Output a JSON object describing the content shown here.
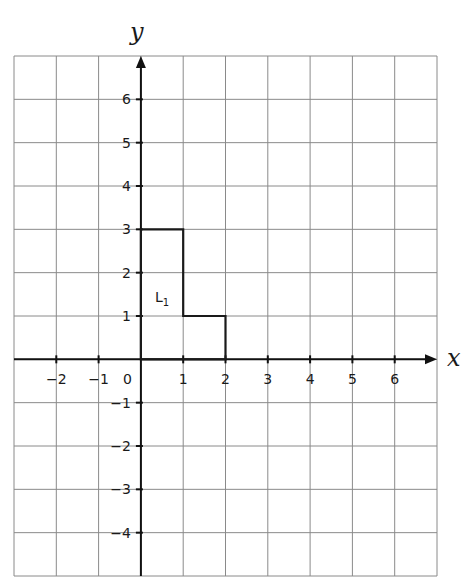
{
  "diagram": {
    "type": "coordinate-grid",
    "x_axis_label": "x",
    "y_axis_label": "y",
    "x_range": [
      -3,
      7
    ],
    "y_range": [
      -5,
      7
    ],
    "x_tick_labels": [
      "−2",
      "−1",
      "1",
      "2",
      "3",
      "4",
      "5",
      "6"
    ],
    "x_tick_values": [
      -2,
      -1,
      1,
      2,
      3,
      4,
      5,
      6
    ],
    "y_tick_labels": [
      "6",
      "5",
      "4",
      "3",
      "2",
      "1",
      "−1",
      "−2",
      "−3",
      "−4"
    ],
    "y_tick_values": [
      6,
      5,
      4,
      3,
      2,
      1,
      -1,
      -2,
      -3,
      -4
    ],
    "origin_label": "0",
    "shape": {
      "name": "L",
      "subscript": "1",
      "vertices": [
        [
          0,
          0
        ],
        [
          0,
          3
        ],
        [
          1,
          3
        ],
        [
          1,
          1
        ],
        [
          2,
          1
        ],
        [
          2,
          0
        ]
      ]
    },
    "colors": {
      "grid": "#8a8a8a",
      "axis": "#111111",
      "shape": "#1a1a1a"
    }
  }
}
